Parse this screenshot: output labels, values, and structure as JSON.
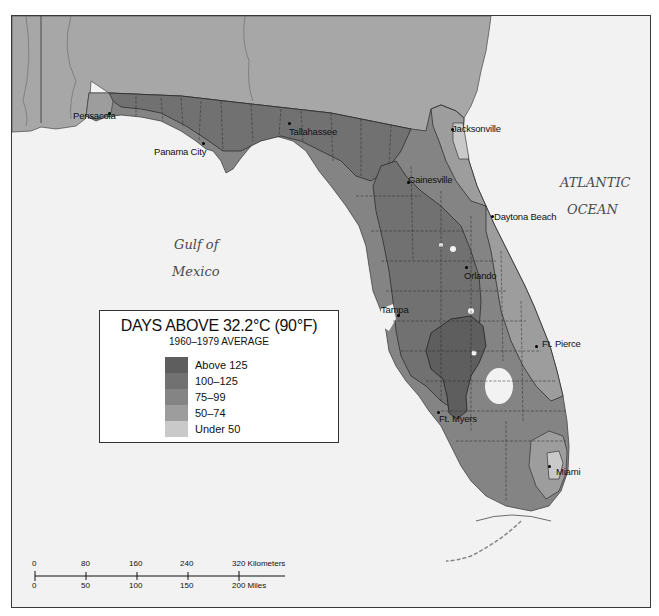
{
  "map": {
    "title": "DAYS ABOVE 32.2°C (90°F)",
    "subtitle": "1960–1979 AVERAGE",
    "water_labels": {
      "gulf_line1": "Gulf of",
      "gulf_line2": "Mexico",
      "atlantic_line1": "ATLANTIC",
      "atlantic_line2": "OCEAN"
    },
    "cities": [
      {
        "name": "Pensacola",
        "x": 73,
        "y": 110
      },
      {
        "name": "Tallahassee",
        "x": 289,
        "y": 126
      },
      {
        "name": "Panama City",
        "x": 154,
        "y": 146
      },
      {
        "name": "Jacksonville",
        "x": 452,
        "y": 126
      },
      {
        "name": "Gainesville",
        "x": 407,
        "y": 176
      },
      {
        "name": "Daytona Beach",
        "x": 493,
        "y": 212
      },
      {
        "name": "Orlando",
        "x": 463,
        "y": 271
      },
      {
        "name": "Tampa",
        "x": 380,
        "y": 305
      },
      {
        "name": "Ft. Pierce",
        "x": 541,
        "y": 340
      },
      {
        "name": "Ft. Myers",
        "x": 438,
        "y": 413
      },
      {
        "name": "Miami",
        "x": 555,
        "y": 467
      }
    ],
    "legend": [
      {
        "label": "Above 125",
        "color": "#5e5e5e"
      },
      {
        "label": "100–125",
        "color": "#717171"
      },
      {
        "label": "75–99",
        "color": "#848484"
      },
      {
        "label": "50–74",
        "color": "#9d9d9d"
      },
      {
        "label": "Under 50",
        "color": "#c9c9c9"
      }
    ],
    "scale_bar": {
      "km_ticks": [
        "0",
        "80",
        "160",
        "240",
        "320 Kilometers"
      ],
      "mile_ticks": [
        "0",
        "50",
        "100",
        "150",
        "200 Miles"
      ]
    },
    "colors": {
      "water": "#f2f2f2",
      "neighbor_states": "#a7a7a7",
      "zone_75_99": "#848484",
      "zone_100_125": "#717171",
      "zone_above_125": "#5e5e5e",
      "zone_50_74": "#9d9d9d",
      "zone_under_50": "#c9c9c9"
    }
  }
}
